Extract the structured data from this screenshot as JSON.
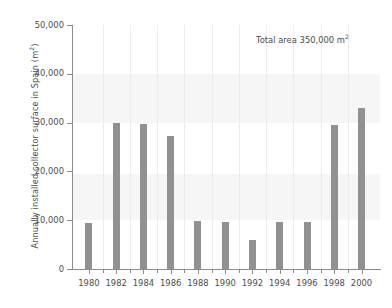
{
  "chart_data": {
    "type": "bar",
    "title": "",
    "xlabel": "",
    "ylabel": "Annually installed collector surface in Spain (m²)",
    "ylabel_base": "Annually installed collector surface in Spain (m",
    "ylabel_sup": "2",
    "ylabel_tail": ")",
    "annotation": "Total area 350,000 m²",
    "annotation_base": "Total area 350,000 m",
    "annotation_sup": "2",
    "categories": [
      1980,
      1981,
      1982,
      1983,
      1984,
      1985,
      1986,
      1987,
      1988,
      1989,
      1990,
      1991,
      1992,
      1993,
      1994,
      1995,
      1996,
      1997,
      1998,
      1999,
      2000
    ],
    "values": [
      9500,
      null,
      30000,
      null,
      29800,
      null,
      27200,
      null,
      9800,
      null,
      9700,
      null,
      6000,
      null,
      9700,
      null,
      9600,
      null,
      29500,
      null,
      33000
    ],
    "bars": [
      {
        "year": "1980",
        "value": 9500
      },
      {
        "year": "1982",
        "value": 30000
      },
      {
        "year": "1984",
        "value": 29800
      },
      {
        "year": "1986",
        "value": 27200
      },
      {
        "year": "1988",
        "value": 9800
      },
      {
        "year": "1990",
        "value": 9700
      },
      {
        "year": "1992",
        "value": 6000
      },
      {
        "year": "1994",
        "value": 9700
      },
      {
        "year": "1996",
        "value": 9600
      },
      {
        "year": "1998",
        "value": 29500
      },
      {
        "year": "2000",
        "value": 33000
      }
    ],
    "ylim": [
      0,
      50000
    ],
    "yticks": [
      0,
      10000,
      20000,
      30000,
      40000,
      50000
    ],
    "ytick_labels": [
      "0",
      "10,000",
      "20,000",
      "30,000",
      "40,000",
      "50,000"
    ],
    "xtick_labels": [
      "1980",
      "1982",
      "1984",
      "1986",
      "1988",
      "1990",
      "1992",
      "1994",
      "1996",
      "1998",
      "2000"
    ],
    "grid": "vertical-faint",
    "legend": "none",
    "bar_color": "#919191",
    "axis_color": "#8c8c8c",
    "text_color": "#4d4d4d",
    "background_color": "#ffffff",
    "band_color": "#f6f6f6"
  }
}
